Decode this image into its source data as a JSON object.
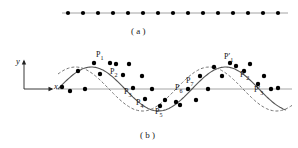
{
  "figure": {
    "panels": [
      {
        "id": "a",
        "caption": "( a )"
      },
      {
        "id": "b",
        "caption": "( b )"
      }
    ]
  },
  "panel_a": {
    "caption": "( a )",
    "line": {
      "x1": 62,
      "x2": 288,
      "y": 13,
      "color": "#9a9a9a"
    },
    "dot_count": 15,
    "dot_radius": 2.1,
    "dot_color": "#000000",
    "dot_x": [
      68,
      83,
      98,
      113,
      128,
      143,
      158,
      173,
      188,
      203,
      218,
      233,
      248,
      263,
      278
    ],
    "dot_y": 13
  },
  "panel_b": {
    "caption": "( b )",
    "axes": {
      "y_label": "y",
      "x_label": "x",
      "origin_x": 24,
      "origin_y": 89,
      "y_top": 61,
      "x_right": 52
    },
    "baseline": {
      "x1": 56,
      "x2": 292,
      "y": 89,
      "color": "#9a9a9a"
    },
    "solid_curve": {
      "color": "#555555",
      "width": 1.1,
      "style": "solid",
      "amplitude": 22,
      "period": 134,
      "phase": 0,
      "x_start": 58,
      "x_end": 286
    },
    "dashed_curve": {
      "color": "#777777",
      "width": 1.0,
      "style": "dashed",
      "dash": "3,2",
      "amplitude": 22,
      "period": 134,
      "phase_shift": 16,
      "x_start": 58,
      "x_end": 292
    },
    "solid_points": [
      {
        "x": 62,
        "y": 87
      },
      {
        "x": 78,
        "y": 71
      },
      {
        "x": 94,
        "y": 63
      },
      {
        "x": 110,
        "y": 63
      },
      {
        "x": 123,
        "y": 75
      },
      {
        "x": 133,
        "y": 88
      },
      {
        "x": 145,
        "y": 99
      },
      {
        "x": 160,
        "y": 106
      },
      {
        "x": 176,
        "y": 102
      },
      {
        "x": 188,
        "y": 89
      },
      {
        "x": 200,
        "y": 76
      },
      {
        "x": 214,
        "y": 67
      },
      {
        "x": 230,
        "y": 63
      },
      {
        "x": 244,
        "y": 71
      },
      {
        "x": 258,
        "y": 84
      },
      {
        "x": 271,
        "y": 89
      }
    ],
    "dashed_points": [
      {
        "x": 70,
        "y": 91
      },
      {
        "x": 85,
        "y": 89
      },
      {
        "x": 100,
        "y": 74
      },
      {
        "x": 116,
        "y": 64
      },
      {
        "x": 129,
        "y": 64
      },
      {
        "x": 142,
        "y": 76
      },
      {
        "x": 152,
        "y": 89
      },
      {
        "x": 165,
        "y": 100
      },
      {
        "x": 180,
        "y": 105
      },
      {
        "x": 196,
        "y": 100
      },
      {
        "x": 208,
        "y": 89
      },
      {
        "x": 222,
        "y": 76
      },
      {
        "x": 236,
        "y": 66
      },
      {
        "x": 250,
        "y": 64
      },
      {
        "x": 264,
        "y": 76
      },
      {
        "x": 278,
        "y": 88
      }
    ],
    "point_radius": 2.2,
    "point_color": "#000000",
    "labels": [
      {
        "name": "P1",
        "text": "P",
        "sub": "1",
        "prime": false,
        "x": 96,
        "y": 50
      },
      {
        "name": "P2",
        "text": "P",
        "sub": "2",
        "prime": false,
        "x": 110,
        "y": 67
      },
      {
        "name": "P3",
        "text": "P",
        "sub": "3",
        "prime": false,
        "x": 124,
        "y": 87
      },
      {
        "name": "P4",
        "text": "P",
        "sub": "4",
        "prime": false,
        "x": 136,
        "y": 98
      },
      {
        "name": "P5",
        "text": "P",
        "sub": "5",
        "prime": false,
        "x": 155,
        "y": 107
      },
      {
        "name": "P6",
        "text": "P",
        "sub": "6",
        "prime": false,
        "x": 175,
        "y": 83
      },
      {
        "name": "P7",
        "text": "P",
        "sub": "7",
        "prime": false,
        "x": 186,
        "y": 76
      },
      {
        "name": "P1p",
        "text": "P",
        "sub": "1",
        "prime": true,
        "x": 224,
        "y": 52
      },
      {
        "name": "P2p",
        "text": "P",
        "sub": "2",
        "prime": true,
        "x": 240,
        "y": 70
      },
      {
        "name": "P3p",
        "text": "P",
        "sub": "3",
        "prime": true,
        "x": 254,
        "y": 85
      }
    ]
  }
}
